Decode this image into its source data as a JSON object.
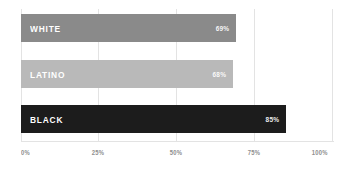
{
  "chart_data": {
    "type": "bar",
    "orientation": "horizontal",
    "title": "",
    "xlabel": "",
    "ylabel": "",
    "categories": [
      "WHITE",
      "LATINO",
      "BLACK"
    ],
    "values": [
      69,
      68,
      85
    ],
    "value_labels": [
      "69%",
      "68%",
      "85%"
    ],
    "series": [
      {
        "name": "",
        "values": [
          69,
          68,
          85
        ]
      }
    ],
    "bars": [
      {
        "category": "WHITE",
        "value": 69,
        "value_label": "69%",
        "color": "#8a8a8a"
      },
      {
        "category": "LATINO",
        "value": 68,
        "value_label": "68%",
        "color": "#b9b9b9"
      },
      {
        "category": "BLACK",
        "value": 85,
        "value_label": "85%",
        "color": "#1c1c1c"
      }
    ],
    "xlim": [
      0,
      100
    ],
    "xticks": [
      0,
      25,
      50,
      75,
      100
    ],
    "xtick_labels": [
      "0%",
      "25%",
      "50%",
      "75%",
      "100%"
    ],
    "grid": true,
    "grid_color": "#e3e3e3",
    "legend": null,
    "legend_position": "none",
    "background_color": "#ffffff",
    "label_text_color": "#ffffff",
    "tick_text_color": "#8e8e8e"
  }
}
